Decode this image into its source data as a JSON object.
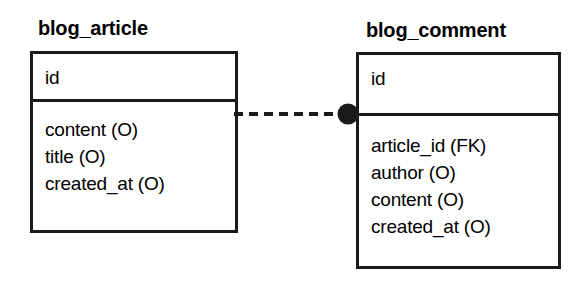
{
  "diagram": {
    "type": "entity-relationship-diagram",
    "background_color": "#ffffff",
    "line_color": "#1a1a1a",
    "entities": [
      {
        "name": "blog_article",
        "key_fields": [
          "id"
        ],
        "attributes": [
          "content (O)",
          "title (O)",
          "created_at (O)"
        ]
      },
      {
        "name": "blog_comment",
        "key_fields": [
          "id"
        ],
        "attributes": [
          "article_id (FK)",
          "author (O)",
          "content (O)",
          "created_at (O)"
        ]
      }
    ],
    "relationship": {
      "from": "blog_article",
      "to": "blog_comment",
      "line_style": "dashed",
      "endpoint_marker": "filled-circle",
      "marker_color": "#1a1a1a"
    }
  }
}
